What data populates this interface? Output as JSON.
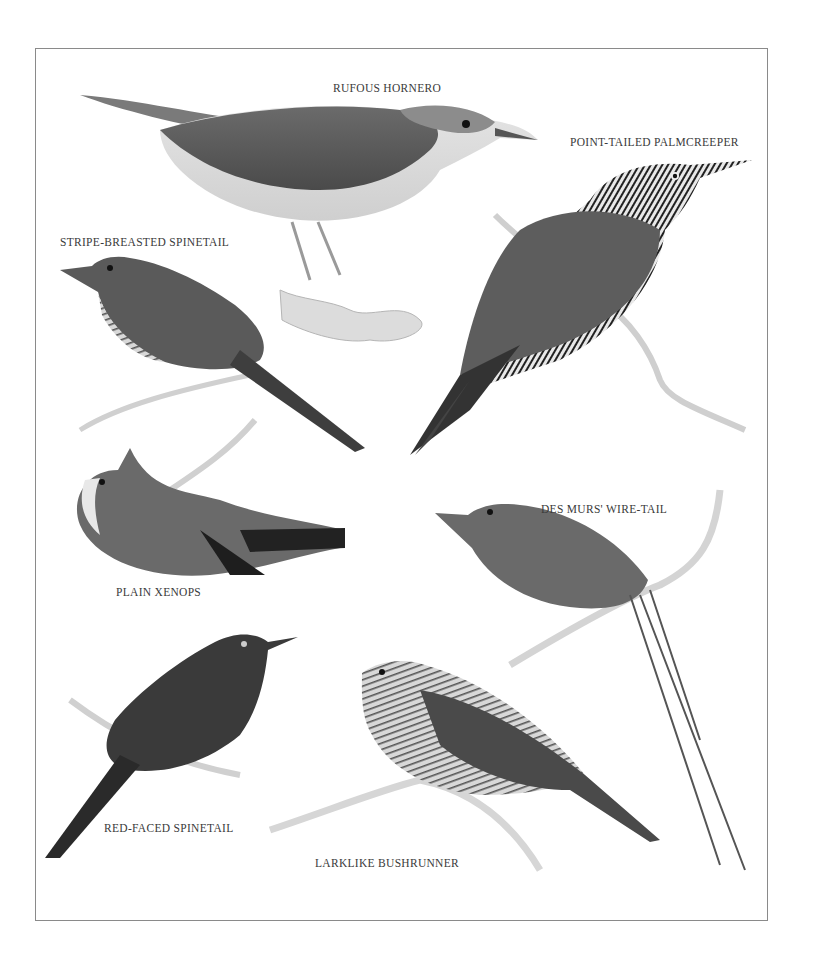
{
  "plate": {
    "frame_color": "#8a8a8a",
    "background": "#ffffff"
  },
  "species": [
    {
      "id": "rufous-hornero",
      "label": "RUFOUS HORNERO",
      "x": 333,
      "y": 82
    },
    {
      "id": "point-tailed-palmcreeper",
      "label": "POINT-TAILED PALMCREEPER",
      "x": 570,
      "y": 136
    },
    {
      "id": "stripe-breasted-spinetail",
      "label": "STRIPE-BREASTED SPINETAIL",
      "x": 60,
      "y": 236
    },
    {
      "id": "plain-xenops",
      "label": "PLAIN XENOPS",
      "x": 116,
      "y": 586
    },
    {
      "id": "des-murs-wire-tail",
      "label": "DES MURS' WIRE-TAIL",
      "x": 541,
      "y": 503
    },
    {
      "id": "red-faced-spinetail",
      "label": "RED-FACED SPINETAIL",
      "x": 104,
      "y": 822
    },
    {
      "id": "larklike-bushrunner",
      "label": "LARKLIKE BUSHRUNNER",
      "x": 315,
      "y": 857
    }
  ]
}
